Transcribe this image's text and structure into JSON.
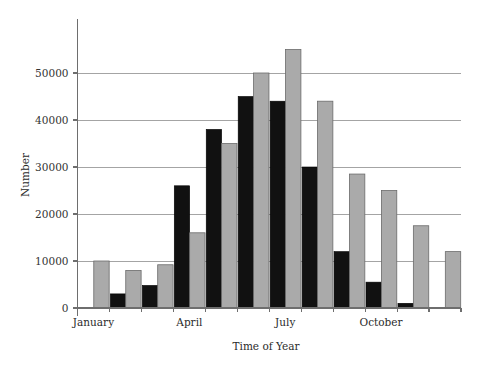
{
  "chart_data": {
    "type": "bar",
    "title": "",
    "subtitle": "",
    "xlabel": "Time of Year",
    "ylabel": "Number",
    "categories": [
      "January",
      "February",
      "March",
      "April",
      "May",
      "June",
      "July",
      "August",
      "September",
      "October",
      "November",
      "December"
    ],
    "visible_tick_labels": [
      "January",
      "April",
      "July",
      "October"
    ],
    "ytick_labels": [
      "0",
      "10000",
      "20000",
      "30000",
      "40000",
      "50000"
    ],
    "ytick_values": [
      0,
      10000,
      20000,
      30000,
      40000,
      50000
    ],
    "ylim": [
      0,
      58000
    ],
    "grid": "horizontal",
    "legend": "none",
    "series": [
      {
        "name": "dark",
        "color": "#111111",
        "values": [
          0,
          3000,
          4800,
          26000,
          38000,
          45000,
          44000,
          30000,
          12000,
          5500,
          1000,
          0
        ]
      },
      {
        "name": "light",
        "color": "#aaaaaa",
        "values": [
          10000,
          8000,
          9200,
          16000,
          35000,
          50000,
          55000,
          44000,
          28500,
          25000,
          17500,
          12000
        ]
      }
    ]
  },
  "figure": {
    "y_axis_title": "Number",
    "x_axis_title": "Time of Year"
  }
}
